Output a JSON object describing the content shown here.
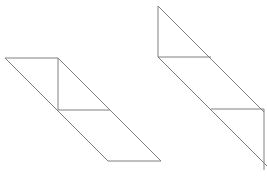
{
  "canvas": {
    "width": 267,
    "height": 178,
    "background_color": "#ffffff"
  },
  "style": {
    "line_color": "#808080",
    "line_width": 1,
    "fill": "none"
  },
  "figures": [
    {
      "name": "left-parallelogram-figure",
      "description": "Slanted parallelogram subdivided by one vertical and one horizontal segment, with a long diagonal from the upper-left corner to the lower-right corner.",
      "vertices": {
        "top_left": [
          5,
          58
        ],
        "top_right": [
          58,
          58
        ],
        "mid_left": [
          58,
          110
        ],
        "mid_right": [
          110,
          110
        ],
        "bottom_left": [
          108,
          161
        ],
        "bottom_right": [
          161,
          161
        ]
      },
      "segments": [
        {
          "name": "top-edge",
          "from": [
            5,
            58
          ],
          "to": [
            58,
            58
          ]
        },
        {
          "name": "upper-vertical",
          "from": [
            58,
            58
          ],
          "to": [
            58,
            110
          ]
        },
        {
          "name": "middle-horizontal",
          "from": [
            58,
            110
          ],
          "to": [
            110,
            110
          ]
        },
        {
          "name": "bottom-edge",
          "from": [
            108,
            161
          ],
          "to": [
            161,
            161
          ]
        },
        {
          "name": "left-slant-edge",
          "from": [
            5,
            58
          ],
          "to": [
            108,
            161
          ]
        },
        {
          "name": "long-diagonal",
          "from": [
            58,
            58
          ],
          "to": [
            161,
            161
          ]
        }
      ]
    },
    {
      "name": "right-parallelogram-figure",
      "description": "Identical slanted parallelogram translated up and to the right, partially cropped at the right edge of the canvas.",
      "vertices": {
        "top_left": [
          158,
          6
        ],
        "top_right": [
          211,
          6
        ],
        "mid_left": [
          158,
          57
        ],
        "mid_right": [
          211,
          57
        ],
        "lower_mid_left": [
          211,
          109
        ],
        "lower_mid_right": [
          264,
          109
        ],
        "bottom_left": [
          261,
          160
        ],
        "bottom_right": [
          267,
          166
        ]
      },
      "segments": [
        {
          "name": "upper-vertical",
          "from": [
            158,
            6
          ],
          "to": [
            158,
            57
          ]
        },
        {
          "name": "upper-horizontal",
          "from": [
            158,
            57
          ],
          "to": [
            211,
            57
          ]
        },
        {
          "name": "lower-horizontal",
          "from": [
            211,
            109
          ],
          "to": [
            264,
            109
          ]
        },
        {
          "name": "right-vertical",
          "from": [
            264,
            109
          ],
          "to": [
            264,
            170
          ]
        },
        {
          "name": "left-slant-edge",
          "from": [
            158,
            57
          ],
          "to": [
            261,
            160
          ]
        },
        {
          "name": "long-diagonal",
          "from": [
            158,
            6
          ],
          "to": [
            264,
            112
          ]
        },
        {
          "name": "bottom-closing-edge",
          "from": [
            261,
            160
          ],
          "to": [
            267,
            166
          ]
        }
      ]
    }
  ]
}
